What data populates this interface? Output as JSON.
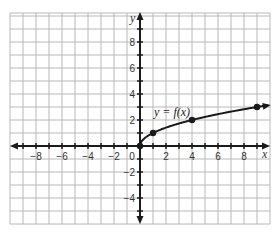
{
  "chart_data": {
    "type": "line",
    "title": "",
    "function_label": "y = f(x)",
    "xlabel": "x",
    "ylabel": "y",
    "xlim": [
      -10,
      10
    ],
    "ylim": [
      -6,
      10
    ],
    "grid": true,
    "x_ticks": [
      -8,
      -6,
      -4,
      -2,
      0,
      2,
      4,
      6,
      8
    ],
    "y_ticks": [
      -4,
      -2,
      2,
      4,
      6,
      8
    ],
    "series": [
      {
        "name": "y = f(x)",
        "points": [
          [
            0,
            0
          ],
          [
            1,
            1
          ],
          [
            4,
            2
          ],
          [
            9,
            3
          ]
        ],
        "curve": "sqrt",
        "endpoint_closed": [
          0,
          0
        ],
        "arrow_end": true
      }
    ],
    "colors": {
      "grid": "#b8b8b8",
      "axis": "#1a1a1a",
      "curve": "#1a1a1a"
    }
  },
  "labels": {
    "x_axis": "x",
    "y_axis": "y",
    "function": "y = f(x)",
    "x_tick_labels": [
      "−8",
      "−6",
      "−4",
      "−2",
      "0",
      "2",
      "4",
      "6",
      "8"
    ],
    "y_tick_labels": [
      "8",
      "6",
      "4",
      "2",
      "−2",
      "−4"
    ]
  }
}
